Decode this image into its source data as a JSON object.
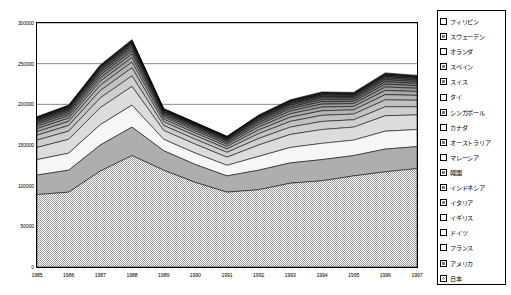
{
  "chart_data": {
    "type": "area",
    "stacked": true,
    "title": "",
    "subtitle": "",
    "xlabel": "",
    "ylabel": "",
    "grid": true,
    "legend_position": "right",
    "xlim": [
      1985,
      1997
    ],
    "ylim": [
      0,
      300000
    ],
    "ytick_interval": 50000,
    "categories": [
      1985,
      1986,
      1987,
      1988,
      1989,
      1990,
      1991,
      1992,
      1993,
      1994,
      1995,
      1996,
      1997
    ],
    "xtick_labels": [
      "1985",
      "1986",
      "1987",
      "1988",
      "1989",
      "1990",
      "1991",
      "1992",
      "1993",
      "1994",
      "1995",
      "1996",
      "1997"
    ],
    "ytick_labels": [
      "0",
      "50000",
      "100000",
      "150000",
      "200000",
      "250000",
      "300000"
    ],
    "stack_order_bottom_to_top": [
      "日本",
      "アメリカ",
      "フランス",
      "ドイツ",
      "イギリス",
      "イタリア",
      "インドネシア",
      "韓国",
      "マレーシア",
      "オーストラリア",
      "カナダ",
      "シンガポール",
      "タイ",
      "スイス",
      "スペイン",
      "オランダ",
      "スウェーデン",
      "フィリピン"
    ],
    "series": [
      {
        "name": "日本",
        "fill": "checker",
        "color": "#b4b4b4",
        "values": [
          89000,
          92000,
          118000,
          137000,
          119000,
          104000,
          92000,
          95000,
          103000,
          106000,
          112000,
          117000,
          121000
        ]
      },
      {
        "name": "アメリカ",
        "fill": "solid-mid",
        "color": "#aeaeae",
        "values": [
          24000,
          27000,
          32000,
          35000,
          24000,
          22000,
          20000,
          24000,
          25000,
          26000,
          25000,
          28000,
          27000
        ]
      },
      {
        "name": "フランス",
        "fill": "solid-white",
        "color": "#f6f6f6",
        "values": [
          19000,
          21000,
          25000,
          27000,
          14000,
          14000,
          13000,
          17000,
          19000,
          20000,
          19000,
          22000,
          21000
        ]
      },
      {
        "name": "ドイツ",
        "fill": "solid-lt",
        "color": "#dcdcdc",
        "values": [
          15000,
          17000,
          21000,
          23000,
          11000,
          11000,
          10000,
          14000,
          16000,
          17000,
          16000,
          19000,
          18000
        ]
      },
      {
        "name": "イギリス",
        "fill": "solid-lt2",
        "color": "#cfcfcf",
        "values": [
          9000,
          10000,
          12000,
          13000,
          6000,
          6000,
          6000,
          8000,
          9000,
          10000,
          9000,
          11000,
          10000
        ]
      },
      {
        "name": "イタリア",
        "fill": "solid-md2",
        "color": "#c2c2c2",
        "values": [
          6000,
          7000,
          9000,
          10000,
          4500,
          4500,
          4200,
          6000,
          7000,
          7500,
          7000,
          8500,
          8000
        ]
      },
      {
        "name": "インドネシア",
        "fill": "solid-md3",
        "color": "#b5b5b5",
        "values": [
          4500,
          5000,
          6500,
          7000,
          3200,
          3200,
          3000,
          4500,
          5200,
          5600,
          5200,
          6400,
          6000
        ]
      },
      {
        "name": "韓国",
        "fill": "solid-md4",
        "color": "#a8a8a8",
        "values": [
          3600,
          4000,
          5000,
          5500,
          2600,
          2600,
          2500,
          3600,
          4200,
          4500,
          4200,
          5200,
          4800
        ]
      },
      {
        "name": "マレーシア",
        "fill": "solid-md5",
        "color": "#9b9b9b",
        "values": [
          2900,
          3200,
          4000,
          4400,
          2100,
          2100,
          2000,
          2900,
          3400,
          3700,
          3400,
          4200,
          3900
        ]
      },
      {
        "name": "オーストラリア",
        "fill": "solid-dk1",
        "color": "#8e8e8e",
        "values": [
          2400,
          2600,
          3300,
          3600,
          1700,
          1700,
          1600,
          2400,
          2800,
          3000,
          2800,
          3500,
          3200
        ]
      },
      {
        "name": "カナダ",
        "fill": "solid-dk2",
        "color": "#818181",
        "values": [
          2000,
          2200,
          2700,
          3000,
          1400,
          1400,
          1350,
          2000,
          2300,
          2500,
          2300,
          2900,
          2700
        ]
      },
      {
        "name": "シンガポール",
        "fill": "solid-dk3",
        "color": "#747474",
        "values": [
          1700,
          1850,
          2300,
          2500,
          1200,
          1200,
          1150,
          1700,
          2000,
          2150,
          2000,
          2500,
          2300
        ]
      },
      {
        "name": "タイ",
        "fill": "solid-dk4",
        "color": "#676767",
        "values": [
          1400,
          1550,
          1900,
          2100,
          1000,
          1000,
          950,
          1400,
          1650,
          1800,
          1650,
          2100,
          1900
        ]
      },
      {
        "name": "スイス",
        "fill": "solid-dk5",
        "color": "#5a5a5a",
        "values": [
          1200,
          1300,
          1600,
          1800,
          850,
          850,
          820,
          1200,
          1400,
          1500,
          1400,
          1750,
          1600
        ]
      },
      {
        "name": "スペイン",
        "fill": "solid-dk6",
        "color": "#4d4d4d",
        "values": [
          1000,
          1100,
          1350,
          1500,
          720,
          720,
          700,
          1000,
          1180,
          1280,
          1180,
          1480,
          1350
        ]
      },
      {
        "name": "オランダ",
        "fill": "solid-dk7",
        "color": "#3f3f3f",
        "values": [
          850,
          930,
          1150,
          1280,
          620,
          620,
          600,
          850,
          1000,
          1080,
          1000,
          1250,
          1150
        ]
      },
      {
        "name": "スウェーデン",
        "fill": "solid-dk8",
        "color": "#303030",
        "values": [
          720,
          790,
          980,
          1080,
          530,
          530,
          510,
          720,
          850,
          920,
          850,
          1060,
          970
        ]
      },
      {
        "name": "フィリピン",
        "fill": "solid-white2",
        "color": "#fbfbfb",
        "values": [
          600,
          660,
          820,
          900,
          450,
          450,
          430,
          600,
          710,
          770,
          710,
          890,
          810
        ]
      }
    ],
    "totals": [
      184870,
      200180,
      248570,
      257240,
      124170,
      111870,
      102965,
      133870,
      147270,
      153380,
      147270,
      263000,
      235680
    ]
  },
  "legend": {
    "items": [
      {
        "label": "フィリピン",
        "swatch": "white"
      },
      {
        "label": "スウェーデン",
        "swatch": "dark"
      },
      {
        "label": "オランダ",
        "swatch": "white"
      },
      {
        "label": "スペイン",
        "swatch": "dark"
      },
      {
        "label": "スイス",
        "swatch": "dark"
      },
      {
        "label": "タイ",
        "swatch": "white"
      },
      {
        "label": "シンガポール",
        "swatch": "dark"
      },
      {
        "label": "カナダ",
        "swatch": "white"
      },
      {
        "label": "オーストラリア",
        "swatch": "dark"
      },
      {
        "label": "マレーシア",
        "swatch": "white"
      },
      {
        "label": "韓国",
        "swatch": "dark"
      },
      {
        "label": "インドネシア",
        "swatch": "dark"
      },
      {
        "label": "イタリア",
        "swatch": "dark"
      },
      {
        "label": "イギリス",
        "swatch": "white"
      },
      {
        "label": "ドイツ",
        "swatch": "white"
      },
      {
        "label": "フランス",
        "swatch": "white"
      },
      {
        "label": "アメリカ",
        "swatch": "dark"
      },
      {
        "label": "日本",
        "swatch": "checker"
      }
    ]
  },
  "colors": {
    "axis": "#000000",
    "grid": "#555555",
    "background": "#ffffff"
  }
}
